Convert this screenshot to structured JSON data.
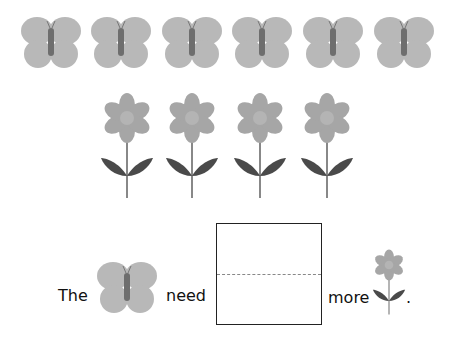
{
  "butterflies_row": {
    "count": 6,
    "icon": "butterfly-icon",
    "centers_x": [
      51,
      121,
      192,
      262,
      333,
      404
    ]
  },
  "flowers_row": {
    "count": 4,
    "icon": "flower-icon",
    "centers_x": [
      127,
      192,
      260,
      327
    ]
  },
  "sentence": {
    "word1": "The",
    "word2": "need",
    "word3": "more",
    "period": ".",
    "answer_box": ""
  },
  "colors": {
    "wing": "#b8b8b8",
    "body": "#6e6e6e",
    "petal": "#a6a6a6",
    "flower_center": "#b4b4b4",
    "leaf": "#4a4a4a",
    "stem": "#888888"
  }
}
